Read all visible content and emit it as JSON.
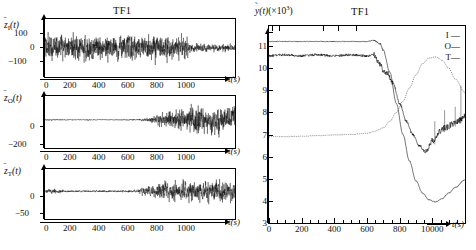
{
  "figure": {
    "left_group": {
      "title": "TF1",
      "xaxis": {
        "label": "t(s)",
        "ticks": [
          "0",
          "200",
          "400",
          "600",
          "800",
          "1000"
        ],
        "tick_values": [
          0,
          200,
          400,
          600,
          800,
          1000
        ],
        "range": [
          0,
          1200
        ]
      },
      "panels": [
        {
          "ylabel_base": "z",
          "ylabel_sub": "I",
          "ylabel_arg": "(t)",
          "yticks": [
            "100",
            "0",
            "−100"
          ],
          "ytick_values": [
            100,
            0,
            -100
          ],
          "ylim": [
            -160,
            160
          ],
          "series_name": "z-bar-I"
        },
        {
          "ylabel_base": "z",
          "ylabel_sub": "O",
          "ylabel_arg": "(t)",
          "yticks": [
            "0",
            "−200"
          ],
          "ytick_values": [
            0,
            -200
          ],
          "ylim": [
            -260,
            220
          ],
          "series_name": "z-bar-O"
        },
        {
          "ylabel_base": "z",
          "ylabel_sub": "T",
          "ylabel_arg": "(t)",
          "yticks": [
            "0",
            "−50"
          ],
          "ytick_values": [
            0,
            -50
          ],
          "ylim": [
            -75,
            60
          ],
          "series_name": "z-bar-T"
        }
      ]
    },
    "right_panel": {
      "title": "TF1",
      "ylabel": "ỹ(t)(×10³)",
      "ylabel_parts": {
        "symbol": "y",
        "arg": "(t)",
        "scale": "(×10³)"
      },
      "yticks": [
        "11",
        "10",
        "9",
        "8",
        "7",
        "6",
        "5",
        "4",
        "3"
      ],
      "ytick_values": [
        11,
        10,
        9,
        8,
        7,
        6,
        5,
        4,
        3
      ],
      "ylim": [
        3,
        11.9
      ],
      "xaxis": {
        "label": "t(s)",
        "ticks": [
          "0",
          "200",
          "400",
          "600",
          "800",
          "10000"
        ],
        "tick_values": [
          0,
          200,
          400,
          600,
          800,
          1000
        ],
        "minor_interval": 100,
        "range": [
          0,
          1200
        ]
      },
      "legend": [
        {
          "key": "I",
          "dash": "solid"
        },
        {
          "key": "O",
          "dash": "solid"
        },
        {
          "key": "T",
          "dash": "solid"
        }
      ]
    }
  },
  "chart_data": [
    {
      "type": "line",
      "title": "TF1",
      "name": "z-bar-I residual noise",
      "xlabel": "t(s)",
      "ylabel": "z̄_I(t)",
      "xlim": [
        0,
        1200
      ],
      "ylim": [
        -160,
        160
      ],
      "grid": false,
      "description": "Zero-mean broadband noise; amplitude envelope ~±110 from t=0 to ~880 s, then drops to ~±35 for t>900 s.",
      "envelope": [
        {
          "t": 0,
          "amp": 95
        },
        {
          "t": 100,
          "amp": 110
        },
        {
          "t": 200,
          "amp": 105
        },
        {
          "t": 300,
          "amp": 108
        },
        {
          "t": 400,
          "amp": 100
        },
        {
          "t": 500,
          "amp": 112
        },
        {
          "t": 600,
          "amp": 105
        },
        {
          "t": 700,
          "amp": 118
        },
        {
          "t": 800,
          "amp": 95
        },
        {
          "t": 880,
          "amp": 100
        },
        {
          "t": 920,
          "amp": 38
        },
        {
          "t": 1000,
          "amp": 33
        },
        {
          "t": 1100,
          "amp": 32
        },
        {
          "t": 1200,
          "amp": 33
        }
      ]
    },
    {
      "type": "line",
      "title": "TF1",
      "name": "z-bar-O residual noise",
      "xlabel": "t(s)",
      "ylabel": "z̄_O(t)",
      "xlim": [
        0,
        1200
      ],
      "ylim": [
        -260,
        220
      ],
      "grid": false,
      "description": "Near-zero flat noise until ~620 s, growing burst afterwards reaching ±200 by 900–1200 s.",
      "envelope": [
        {
          "t": 0,
          "amp": 10
        },
        {
          "t": 100,
          "amp": 8
        },
        {
          "t": 200,
          "amp": 7
        },
        {
          "t": 300,
          "amp": 8
        },
        {
          "t": 400,
          "amp": 7
        },
        {
          "t": 500,
          "amp": 8
        },
        {
          "t": 600,
          "amp": 12
        },
        {
          "t": 660,
          "amp": 30
        },
        {
          "t": 700,
          "amp": 70
        },
        {
          "t": 760,
          "amp": 110
        },
        {
          "t": 820,
          "amp": 140
        },
        {
          "t": 880,
          "amp": 175
        },
        {
          "t": 950,
          "amp": 185
        },
        {
          "t": 1050,
          "amp": 195
        },
        {
          "t": 1150,
          "amp": 190
        },
        {
          "t": 1200,
          "amp": 185
        }
      ]
    },
    {
      "type": "line",
      "title": "TF1",
      "name": "z-bar-T residual noise",
      "xlabel": "t(s)",
      "ylabel": "z̄_T(t)",
      "xlim": [
        0,
        1200
      ],
      "ylim": [
        -75,
        60
      ],
      "grid": false,
      "description": "Small noise (±5) until ~600 s, then large fluctuations reaching ±45 between 700 and 1200 s.",
      "envelope": [
        {
          "t": 0,
          "amp": 7
        },
        {
          "t": 60,
          "amp": 9
        },
        {
          "t": 150,
          "amp": 4
        },
        {
          "t": 300,
          "amp": 4
        },
        {
          "t": 450,
          "amp": 4
        },
        {
          "t": 570,
          "amp": 5
        },
        {
          "t": 620,
          "amp": 14
        },
        {
          "t": 680,
          "amp": 22
        },
        {
          "t": 740,
          "amp": 40
        },
        {
          "t": 820,
          "amp": 38
        },
        {
          "t": 900,
          "amp": 42
        },
        {
          "t": 1000,
          "amp": 40
        },
        {
          "t": 1100,
          "amp": 44
        },
        {
          "t": 1200,
          "amp": 42
        }
      ]
    },
    {
      "type": "line",
      "title": "TF1",
      "name": "y-tilde outputs",
      "xlabel": "t(s)",
      "ylabel": "ỹ(t)(×10³)",
      "xlim": [
        0,
        1200
      ],
      "ylim": [
        3,
        11.9
      ],
      "grid": false,
      "legend_position": "top-right",
      "series": [
        {
          "name": "I",
          "x": [
            0,
            100,
            200,
            300,
            400,
            500,
            600,
            640,
            680,
            700,
            720,
            760,
            800,
            840,
            880,
            920,
            960,
            1000,
            1040,
            1080,
            1120,
            1160,
            1200
          ],
          "values": [
            10.55,
            10.6,
            10.55,
            10.6,
            10.55,
            10.6,
            10.55,
            10.6,
            10.2,
            9.9,
            9.8,
            9.3,
            8.4,
            7.6,
            7.0,
            6.5,
            6.2,
            6.7,
            7.1,
            7.3,
            7.45,
            7.6,
            7.85
          ]
        },
        {
          "name": "O",
          "x": [
            0,
            100,
            200,
            300,
            400,
            500,
            600,
            640,
            680,
            700,
            740,
            780,
            820,
            860,
            900,
            940,
            980,
            1020,
            1060,
            1100,
            1140,
            1200
          ],
          "values": [
            11.2,
            11.2,
            11.2,
            11.2,
            11.2,
            11.2,
            11.2,
            11.25,
            11.1,
            10.8,
            9.8,
            8.4,
            7.0,
            5.8,
            4.9,
            4.35,
            4.05,
            3.95,
            4.1,
            4.35,
            4.6,
            4.95
          ]
        },
        {
          "name": "T",
          "x": [
            0,
            100,
            200,
            300,
            400,
            500,
            600,
            650,
            700,
            740,
            780,
            820,
            860,
            900,
            940,
            980,
            1020,
            1060,
            1100,
            1140,
            1200
          ],
          "values": [
            6.9,
            6.9,
            6.92,
            6.95,
            6.98,
            7.0,
            7.05,
            7.15,
            7.3,
            7.6,
            8.0,
            8.5,
            9.1,
            9.7,
            10.2,
            10.45,
            10.5,
            10.35,
            10.0,
            9.5,
            8.9
          ]
        }
      ]
    }
  ]
}
